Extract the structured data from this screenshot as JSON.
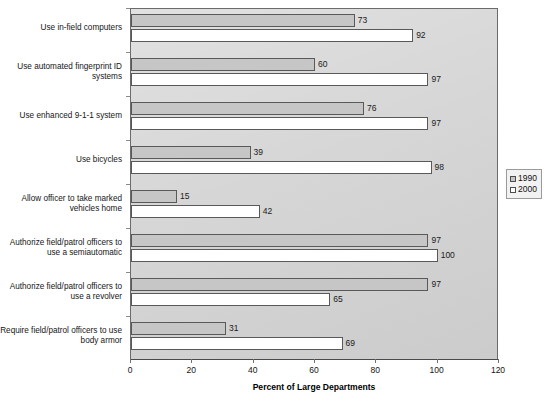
{
  "chart_data": {
    "type": "bar",
    "orientation": "horizontal",
    "title": "",
    "xlabel": "Percent of Large Departments",
    "ylabel": "",
    "xlim": [
      0,
      120
    ],
    "xticks": [
      0,
      20,
      40,
      60,
      80,
      100,
      120
    ],
    "grid": false,
    "legend_position": "right",
    "categories": [
      "Use in-field computers",
      "Use automated fingerprint ID systems",
      "Use enhanced 9-1-1 system",
      "Use bicycles",
      "Allow officer to take marked vehicles home",
      "Authorize field/patrol officers to use a semiautomatic",
      "Authorize field/patrol officers to use a revolver",
      "Require field/patrol officers to use body armor"
    ],
    "category_lines": [
      [
        "Use in-field computers"
      ],
      [
        "Use automated fingerprint ID",
        "systems"
      ],
      [
        "Use enhanced 9-1-1 system"
      ],
      [
        "Use bicycles"
      ],
      [
        "Allow officer to take marked",
        "vehicles home"
      ],
      [
        "Authorize field/patrol officers to",
        "use a semiautomatic"
      ],
      [
        "Authorize field/patrol officers to",
        "use a revolver"
      ],
      [
        "Require field/patrol officers to use",
        "body armor"
      ]
    ],
    "series": [
      {
        "name": "1990",
        "color": "#c6c6c6",
        "values": [
          73,
          60,
          76,
          39,
          15,
          97,
          97,
          31
        ]
      },
      {
        "name": "2000",
        "color": "#ffffff",
        "values": [
          92,
          97,
          97,
          98,
          42,
          100,
          65,
          69
        ]
      }
    ]
  },
  "legend": {
    "items": [
      {
        "label": "1990",
        "swatch": "y1990"
      },
      {
        "label": "2000",
        "swatch": "y2000"
      }
    ]
  },
  "axis": {
    "x_title": "Percent of Large Departments",
    "tick_labels": [
      "0",
      "20",
      "40",
      "60",
      "80",
      "100",
      "120"
    ]
  }
}
